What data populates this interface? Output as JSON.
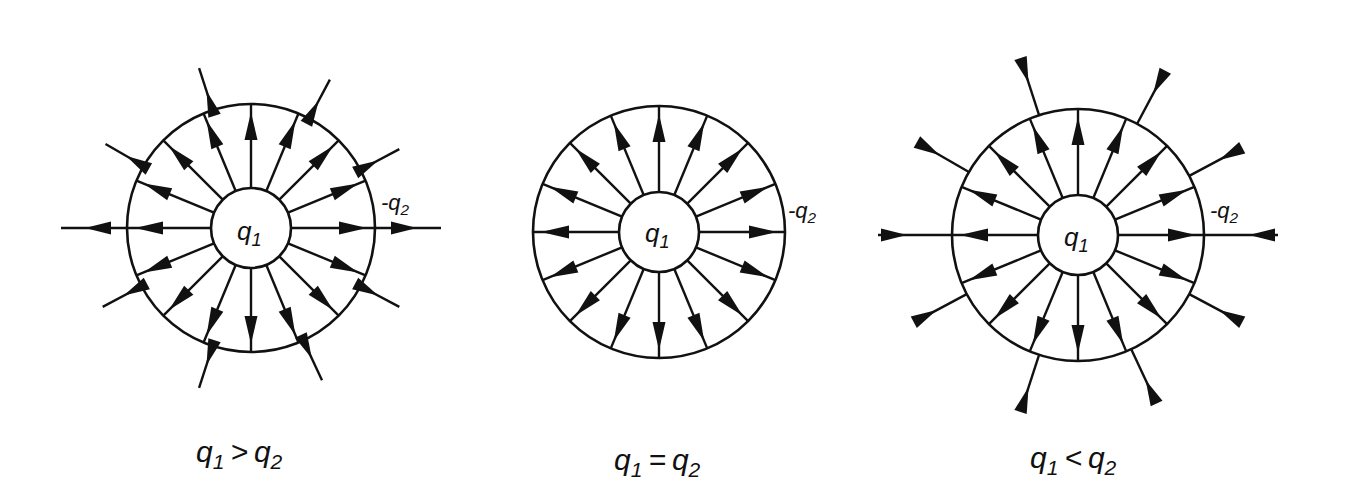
{
  "figure": {
    "ink_color": "#111111",
    "background": "#ffffff",
    "panels": [
      {
        "id": "greater",
        "inner_charge": {
          "symbol": "q",
          "subscript": "1"
        },
        "outer_charge": {
          "symbol": "-q",
          "subscript": "2"
        },
        "caption": {
          "lhs": "q",
          "lhs_sub": "1",
          "relation": ">",
          "rhs": "q",
          "rhs_sub": "2"
        },
        "inner_radial_arrows": 16,
        "outer_field_lines": 10,
        "outer_field_direction": "outward"
      },
      {
        "id": "equal",
        "inner_charge": {
          "symbol": "q",
          "subscript": "1"
        },
        "outer_charge": {
          "symbol": "-q",
          "subscript": "2"
        },
        "caption": {
          "lhs": "q",
          "lhs_sub": "1",
          "relation": "=",
          "rhs": "q",
          "rhs_sub": "2"
        },
        "inner_radial_arrows": 16,
        "outer_field_lines": 0,
        "outer_field_direction": "none"
      },
      {
        "id": "less",
        "inner_charge": {
          "symbol": "q",
          "subscript": "1"
        },
        "outer_charge": {
          "symbol": "-q",
          "subscript": "2"
        },
        "caption": {
          "lhs": "q",
          "lhs_sub": "1",
          "relation": "<",
          "rhs": "q",
          "rhs_sub": "2"
        },
        "inner_radial_arrows": 16,
        "outer_field_lines": 10,
        "outer_field_direction": "inward"
      }
    ]
  }
}
